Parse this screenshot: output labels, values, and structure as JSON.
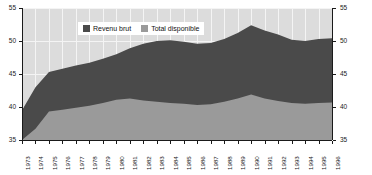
{
  "chart_data": {
    "type": "area",
    "title": "",
    "subtitle": "",
    "xlabel": "",
    "ylabel": "",
    "ylim": [
      35,
      55
    ],
    "yticks": [
      35,
      40,
      45,
      50,
      55
    ],
    "right_axis": true,
    "right_yticks": [
      35,
      40,
      45,
      50,
      55
    ],
    "grid": true,
    "legend_position": "top-center",
    "categories": [
      "1973",
      "1974",
      "1975",
      "1976",
      "1977",
      "1978",
      "1979",
      "1980",
      "1981",
      "1982",
      "1983",
      "1984",
      "1985",
      "1986",
      "1987",
      "1988",
      "1989",
      "1990",
      "1991",
      "1992",
      "1993",
      "1994",
      "1995",
      "1996"
    ],
    "series": [
      {
        "name": "Revenu brut",
        "color": "#4a4a4a",
        "values": [
          39.5,
          43.0,
          45.3,
          45.8,
          46.3,
          46.7,
          47.3,
          48.0,
          48.9,
          49.6,
          50.0,
          50.1,
          49.9,
          49.6,
          49.7,
          50.3,
          51.2,
          52.4,
          51.6,
          51.0,
          50.2,
          50.0,
          50.3,
          50.4
        ]
      },
      {
        "name": "Total disponible",
        "color": "#9a9a9a",
        "values": [
          35.0,
          36.7,
          39.3,
          39.6,
          39.9,
          40.2,
          40.6,
          41.1,
          41.3,
          41.0,
          40.8,
          40.6,
          40.5,
          40.3,
          40.4,
          40.8,
          41.3,
          41.9,
          41.3,
          40.9,
          40.6,
          40.5,
          40.6,
          40.7
        ]
      }
    ]
  },
  "legend": {
    "items": [
      {
        "label": "Revenu brut",
        "color": "#4a4a4a"
      },
      {
        "label": "Total disponible",
        "color": "#9a9a9a"
      }
    ]
  },
  "colors": {
    "plot_background": "#dcdcdc",
    "gridline": "#f4f4f4",
    "axis": "#1a1a1a",
    "series_dark": "#4a4a4a",
    "series_light": "#9a9a9a",
    "page_background": "#ffffff"
  }
}
